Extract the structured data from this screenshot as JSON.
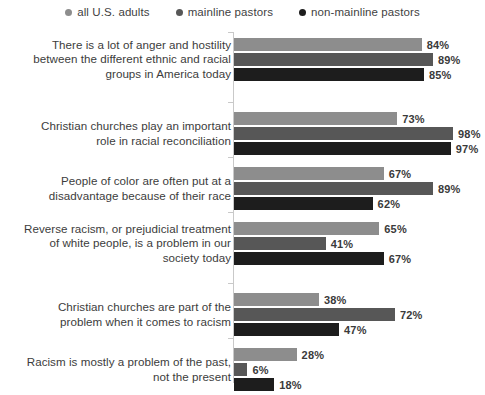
{
  "legend": {
    "items": [
      {
        "label": "all U.S. adults",
        "color": "#8d8d8d"
      },
      {
        "label": "mainline pastors",
        "color": "#575757"
      },
      {
        "label": "non-mainline pastors",
        "color": "#1d1d1d"
      }
    ]
  },
  "chart_data": {
    "type": "bar",
    "orientation": "horizontal",
    "title": "",
    "xlabel": "",
    "ylabel": "",
    "xlim": [
      0,
      100
    ],
    "grid": false,
    "legend_position": "top-center",
    "value_suffix": "%",
    "categories": [
      "There is a lot of anger and hostility between the different ethnic and racial groups in America today",
      "Christian churches play an important role in racial reconciliation",
      "People of color are often put at a disadvantage because of their race",
      "Reverse racism, or prejudicial treatment of white people, is a problem in our society today",
      "Christian churches are part of the problem when it comes to racism",
      "Racism is mostly a problem of the past, not the present"
    ],
    "series": [
      {
        "name": "all U.S. adults",
        "color": "#8d8d8d",
        "values": [
          84,
          73,
          67,
          65,
          38,
          28
        ]
      },
      {
        "name": "mainline pastors",
        "color": "#575757",
        "values": [
          89,
          98,
          89,
          41,
          72,
          6
        ]
      },
      {
        "name": "non-mainline pastors",
        "color": "#1d1d1d",
        "values": [
          85,
          97,
          62,
          67,
          47,
          18
        ]
      }
    ],
    "labels": [
      [
        "84%",
        "89%",
        "85%"
      ],
      [
        "73%",
        "98%",
        "97%"
      ],
      [
        "67%",
        "89%",
        "62%"
      ],
      [
        "65%",
        "41%",
        "67%"
      ],
      [
        "38%",
        "72%",
        "47%"
      ],
      [
        "28%",
        "6%",
        "18%"
      ]
    ]
  },
  "groups": [
    {
      "label_lines": [
        "There is a lot of anger and hostility",
        "between the different ethnic and racial",
        "groups in America today"
      ],
      "bars": [
        {
          "series": "all U.S. adults",
          "value": 84,
          "label": "84%"
        },
        {
          "series": "mainline pastors",
          "value": 89,
          "label": "89%"
        },
        {
          "series": "non-mainline pastors",
          "value": 85,
          "label": "85%"
        }
      ]
    },
    {
      "label_lines": [
        "Christian churches play an important",
        "role in racial reconciliation"
      ],
      "bars": [
        {
          "series": "all U.S. adults",
          "value": 73,
          "label": "73%"
        },
        {
          "series": "mainline pastors",
          "value": 98,
          "label": "98%"
        },
        {
          "series": "non-mainline pastors",
          "value": 97,
          "label": "97%"
        }
      ]
    },
    {
      "label_lines": [
        "People of color are often put at a",
        "disadvantage because of their race"
      ],
      "bars": [
        {
          "series": "all U.S. adults",
          "value": 67,
          "label": "67%"
        },
        {
          "series": "mainline pastors",
          "value": 89,
          "label": "89%"
        },
        {
          "series": "non-mainline pastors",
          "value": 62,
          "label": "62%"
        }
      ]
    },
    {
      "label_lines": [
        "Reverse racism, or prejudicial treatment",
        "of white people, is a problem in our",
        "society today"
      ],
      "bars": [
        {
          "series": "all U.S. adults",
          "value": 65,
          "label": "65%"
        },
        {
          "series": "mainline pastors",
          "value": 41,
          "label": "41%"
        },
        {
          "series": "non-mainline pastors",
          "value": 67,
          "label": "67%"
        }
      ]
    },
    {
      "label_lines": [
        "Christian churches are part of the",
        "problem when it comes to racism"
      ],
      "bars": [
        {
          "series": "all U.S. adults",
          "value": 38,
          "label": "38%"
        },
        {
          "series": "mainline pastors",
          "value": 72,
          "label": "72%"
        },
        {
          "series": "non-mainline pastors",
          "value": 47,
          "label": "47%"
        }
      ]
    },
    {
      "label_lines": [
        "Racism is mostly a problem of the past,",
        "not the present"
      ],
      "bars": [
        {
          "series": "all U.S. adults",
          "value": 28,
          "label": "28%"
        },
        {
          "series": "mainline pastors",
          "value": 6,
          "label": "6%"
        },
        {
          "series": "non-mainline pastors",
          "value": 18,
          "label": "18%"
        }
      ]
    }
  ],
  "layout": {
    "group_tops": [
      8,
      82,
      137,
      192,
      263,
      318
    ],
    "axis_color": "#c9c9c9",
    "px_per_unit": 2.235
  }
}
